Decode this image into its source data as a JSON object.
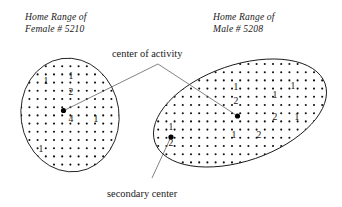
{
  "figure": {
    "background_color": "#ffffff",
    "ink_color": "#1a1a1a",
    "leader_color": "#5a5a5a",
    "width": 342,
    "height": 207
  },
  "titles": {
    "left": {
      "line1": "Home Range of",
      "line2": "Female # 5210"
    },
    "right": {
      "line1": "Home Range of",
      "line2": "Male # 5208"
    }
  },
  "annotations": {
    "center_of_activity": "center of activity",
    "secondary_center": "secondary center"
  },
  "chart_data": {
    "type": "scatter",
    "xlabel": "",
    "ylabel": "",
    "grid": false,
    "legend": false,
    "ranges": [
      {
        "id": "female-5210",
        "label": "Home Range of Female # 5210",
        "animal": "Female",
        "id_number": "5210",
        "shape": "ellipse",
        "cx": 70,
        "cy": 115,
        "rx": 49,
        "ry": 57,
        "rotation": -8,
        "dot_spacing_x": 8.2,
        "dot_spacing_y": 8.2,
        "centers": [
          {
            "kind": "center of activity",
            "x": 63.5,
            "y": 110.5,
            "r": 2.6
          }
        ],
        "counts": [
          {
            "value": "1",
            "x": 46,
            "y": 84
          },
          {
            "value": "1",
            "x": 71,
            "y": 79
          },
          {
            "value": "2",
            "x": 71,
            "y": 95
          },
          {
            "value": "4",
            "x": 71,
            "y": 122
          },
          {
            "value": "1",
            "x": 96,
            "y": 122
          },
          {
            "value": "1",
            "x": 41,
            "y": 152
          }
        ]
      },
      {
        "id": "male-5208",
        "label": "Home Range of Male # 5208",
        "animal": "Male",
        "id_number": "5208",
        "shape": "ellipse",
        "cx": 240,
        "cy": 113,
        "rx": 90,
        "ry": 48,
        "rotation": -19,
        "dot_spacing_x": 8.2,
        "dot_spacing_y": 8.2,
        "centers": [
          {
            "kind": "center of activity",
            "x": 237.5,
            "y": 116.0,
            "r": 2.6
          },
          {
            "kind": "secondary center",
            "x": 171.0,
            "y": 137.0,
            "r": 2.6
          }
        ],
        "counts": [
          {
            "value": "1",
            "x": 236,
            "y": 90
          },
          {
            "value": "2",
            "x": 236,
            "y": 104
          },
          {
            "value": "1",
            "x": 293,
            "y": 89
          },
          {
            "value": "1",
            "x": 275,
            "y": 98
          },
          {
            "value": "2",
            "x": 275,
            "y": 120
          },
          {
            "value": "1",
            "x": 297,
            "y": 120
          },
          {
            "value": "1",
            "x": 234,
            "y": 138
          },
          {
            "value": "2",
            "x": 259,
            "y": 138
          },
          {
            "value": "1",
            "x": 171,
            "y": 130
          },
          {
            "value": "2",
            "x": 171,
            "y": 146
          }
        ]
      }
    ],
    "leaders": [
      {
        "name": "coa-to-female",
        "from": [
          158,
          64
        ],
        "to": [
          65,
          110
        ]
      },
      {
        "name": "coa-to-male",
        "from": [
          158,
          64
        ],
        "to": [
          236,
          115
        ]
      },
      {
        "name": "secondary-to-male",
        "from": [
          152,
          178
        ],
        "to": [
          170,
          139
        ]
      }
    ]
  }
}
